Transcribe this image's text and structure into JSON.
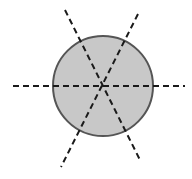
{
  "diagram": {
    "circle": {
      "cx": 103,
      "cy": 86,
      "r": 50,
      "fill": "#c8c8c8",
      "stroke": "#555555"
    },
    "lines": [
      {
        "name": "horizontal-axis",
        "x1": 13,
        "y1": 86,
        "x2": 185,
        "y2": 86
      },
      {
        "name": "diagonal-axis-1",
        "x1": 65,
        "y1": 10,
        "x2": 141,
        "y2": 162
      },
      {
        "name": "diagonal-axis-2",
        "x1": 138,
        "y1": 14,
        "x2": 61,
        "y2": 167
      }
    ],
    "line_color": "#1a1a1a"
  }
}
